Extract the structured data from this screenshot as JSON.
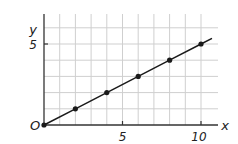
{
  "chart_data": {
    "type": "line",
    "title": "",
    "xlabel": "x",
    "ylabel": "y",
    "origin_label": "O",
    "x": [
      0,
      2,
      4,
      6,
      8,
      10
    ],
    "series": [
      {
        "name": "y = x/2",
        "values": [
          0,
          1,
          2,
          3,
          4,
          5
        ],
        "markers": true,
        "color": "#1a1a1a"
      }
    ],
    "line_extends_to": {
      "x": 10.7,
      "y": 5.35
    },
    "xlim": [
      0,
      11
    ],
    "ylim": [
      0,
      7
    ],
    "x_ticks": [
      {
        "value": 5,
        "label": "5"
      },
      {
        "value": 10,
        "label": "10"
      }
    ],
    "y_ticks": [
      {
        "value": 5,
        "label": "5"
      }
    ],
    "grid": {
      "on": true,
      "x_step": 1,
      "y_step": 1,
      "color": "#cfcfcf"
    },
    "legend": null
  },
  "axes": {
    "x_label": "x",
    "y_label": "y",
    "origin_label": "O",
    "x_tick_5": "5",
    "x_tick_10": "10",
    "y_tick_5": "5"
  }
}
